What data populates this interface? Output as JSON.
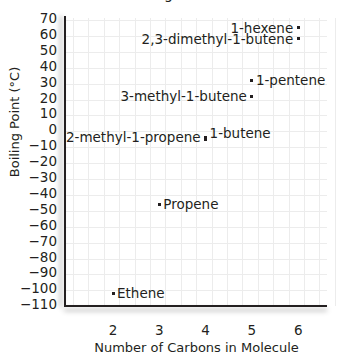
{
  "chart_data": {
    "type": "scatter",
    "xlabel": "Number of Carbons in Molecule",
    "ylabel": "Boiling Point (°C)",
    "xlim": [
      1,
      6.6
    ],
    "ylim": [
      -110,
      70
    ],
    "x_ticks": [
      "2",
      "3",
      "4",
      "5",
      "6"
    ],
    "y_ticks": [
      "70",
      "60",
      "50",
      "40",
      "30",
      "20",
      "10",
      "0",
      "−10",
      "−20",
      "−30",
      "−40",
      "−50",
      "−60",
      "−70",
      "−80",
      "−90",
      "−100",
      "−110"
    ],
    "grid": true,
    "legend": null,
    "points": [
      {
        "name": "1-hexene",
        "x": 6,
        "y": 63
      },
      {
        "name": "2,3-dimethyl-1-butene",
        "x": 6,
        "y": 56
      },
      {
        "name": "1-pentene",
        "x": 5,
        "y": 30
      },
      {
        "name": "3-methyl-1-butene",
        "x": 5,
        "y": 20
      },
      {
        "name": "1-butene",
        "x": 4,
        "y": -6
      },
      {
        "name": "2-methyl-1-propene",
        "x": 4,
        "y": -7
      },
      {
        "name": "Propene",
        "x": 3,
        "y": -48
      },
      {
        "name": "Ethene",
        "x": 2,
        "y": -104
      }
    ]
  },
  "labels": {
    "title_visible": "g",
    "xlabel": "Number of Carbons in Molecule",
    "ylabel": "Boiling Point (°C)"
  }
}
